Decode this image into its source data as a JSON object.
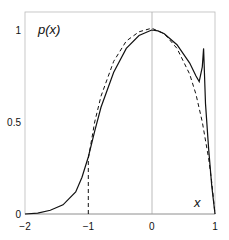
{
  "chart_data": {
    "type": "line",
    "title": "",
    "xlabel": "x",
    "ylabel": "p(x)",
    "xlim": [
      -2,
      1
    ],
    "ylim": [
      0,
      1.1
    ],
    "xticks": [
      "-2",
      "-1",
      "0",
      "1"
    ],
    "yticks": [
      "0",
      "0.5",
      "1"
    ],
    "grid": false,
    "legend": null,
    "annotations": [
      "vertical reference line at x = 0"
    ],
    "series": [
      {
        "name": "solid",
        "style": "solid",
        "x": [
          -2,
          -1.8,
          -1.6,
          -1.4,
          -1.2,
          -1.1,
          -1.0,
          -0.9,
          -0.8,
          -0.6,
          -0.4,
          -0.2,
          0.0,
          0.1,
          0.2,
          0.4,
          0.6,
          0.7,
          0.75,
          0.8,
          0.82,
          0.85,
          0.9,
          0.95,
          1.0
        ],
        "values": [
          0.0,
          0.005,
          0.02,
          0.05,
          0.12,
          0.2,
          0.31,
          0.45,
          0.58,
          0.77,
          0.9,
          0.97,
          1.0,
          0.995,
          0.98,
          0.92,
          0.82,
          0.75,
          0.72,
          0.8,
          0.9,
          0.6,
          0.35,
          0.15,
          0.0
        ]
      },
      {
        "name": "dashed",
        "style": "dashed",
        "x": [
          -1.0,
          -1.0,
          -0.9,
          -0.8,
          -0.6,
          -0.4,
          -0.2,
          0.0,
          0.2,
          0.4,
          0.6,
          0.7,
          0.8,
          0.9,
          0.95,
          1.0
        ],
        "values": [
          0.0,
          0.3,
          0.5,
          0.64,
          0.83,
          0.94,
          0.99,
          1.01,
          0.98,
          0.9,
          0.76,
          0.65,
          0.5,
          0.3,
          0.17,
          0.0
        ]
      }
    ]
  }
}
